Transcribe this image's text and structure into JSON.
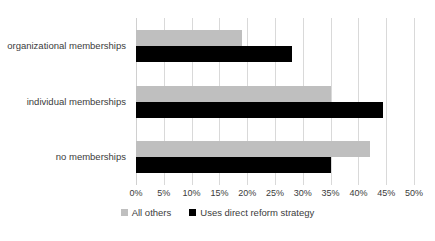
{
  "chart_data": {
    "type": "bar",
    "orientation": "horizontal",
    "title": "",
    "xlabel": "",
    "ylabel": "",
    "xlim": [
      0,
      50
    ],
    "xtick_labels": [
      "0%",
      "5%",
      "10%",
      "15%",
      "20%",
      "25%",
      "30%",
      "35%",
      "40%",
      "45%",
      "50%"
    ],
    "xtick_values": [
      0,
      5,
      10,
      15,
      20,
      25,
      30,
      35,
      40,
      45,
      50
    ],
    "grid": true,
    "legend_position": "bottom-center",
    "categories": [
      "organizational memberships",
      "individual memberships",
      "no memberships"
    ],
    "series": [
      {
        "name": "All others",
        "color": "#bfbfbf",
        "values": [
          19,
          35,
          42
        ]
      },
      {
        "name": "Uses direct reform strategy",
        "color": "#000000",
        "values": [
          28,
          44.5,
          35
        ]
      }
    ]
  },
  "colors": {
    "all_others": "#bfbfbf",
    "uses_direct_reform_strategy": "#000000",
    "gridline": "#d9d9d9",
    "text": "#3b3b3b",
    "background": "#ffffff"
  }
}
